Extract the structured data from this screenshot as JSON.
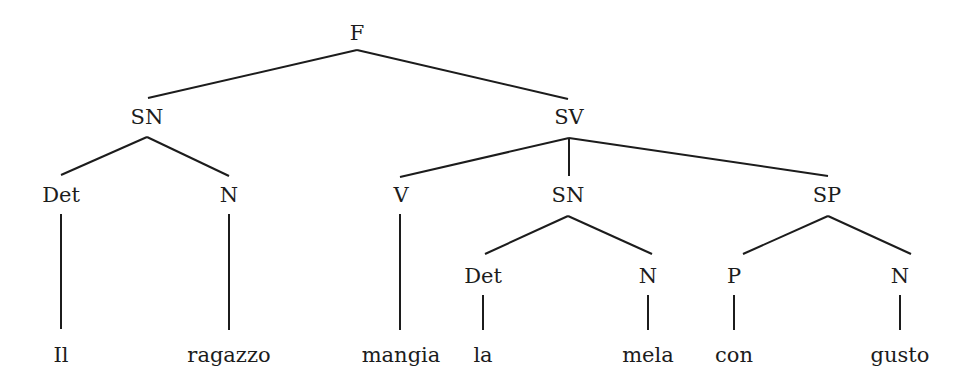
{
  "diagram": {
    "type": "syntax-tree",
    "nodes": [
      {
        "id": "F",
        "label": "F",
        "x": 357,
        "y": 40,
        "kind": "category"
      },
      {
        "id": "SN1",
        "label": "SN",
        "x": 147,
        "y": 124,
        "kind": "category"
      },
      {
        "id": "SV",
        "label": "SV",
        "x": 569,
        "y": 124,
        "kind": "category"
      },
      {
        "id": "Det1",
        "label": "Det",
        "x": 61,
        "y": 202,
        "kind": "category"
      },
      {
        "id": "N1",
        "label": "N",
        "x": 229,
        "y": 202,
        "kind": "category"
      },
      {
        "id": "V",
        "label": "V",
        "x": 401,
        "y": 202,
        "kind": "category"
      },
      {
        "id": "SN2",
        "label": "SN",
        "x": 568,
        "y": 202,
        "kind": "category"
      },
      {
        "id": "SP",
        "label": "SP",
        "x": 827,
        "y": 202,
        "kind": "category"
      },
      {
        "id": "Det2",
        "label": "Det",
        "x": 483,
        "y": 283,
        "kind": "category"
      },
      {
        "id": "N2",
        "label": "N",
        "x": 648,
        "y": 283,
        "kind": "category"
      },
      {
        "id": "P",
        "label": "P",
        "x": 734,
        "y": 283,
        "kind": "category"
      },
      {
        "id": "N3",
        "label": "N",
        "x": 900,
        "y": 283,
        "kind": "category"
      },
      {
        "id": "w1",
        "label": "Il",
        "x": 61,
        "y": 362,
        "kind": "word"
      },
      {
        "id": "w2",
        "label": "ragazzo",
        "x": 229,
        "y": 362,
        "kind": "word"
      },
      {
        "id": "w3",
        "label": "mangia",
        "x": 401,
        "y": 362,
        "kind": "word"
      },
      {
        "id": "w4",
        "label": "la",
        "x": 483,
        "y": 362,
        "kind": "word"
      },
      {
        "id": "w5",
        "label": "mela",
        "x": 648,
        "y": 362,
        "kind": "word"
      },
      {
        "id": "w6",
        "label": "con",
        "x": 734,
        "y": 362,
        "kind": "word"
      },
      {
        "id": "w7",
        "label": "gusto",
        "x": 900,
        "y": 362,
        "kind": "word"
      }
    ],
    "edges": [
      {
        "from": "F",
        "to": "SN1",
        "x1": 357,
        "y1": 50,
        "x2": 148,
        "y2": 98
      },
      {
        "from": "F",
        "to": "SV",
        "x1": 357,
        "y1": 50,
        "x2": 568,
        "y2": 99
      },
      {
        "from": "SN1",
        "to": "Det1",
        "x1": 147,
        "y1": 137,
        "x2": 61,
        "y2": 175
      },
      {
        "from": "SN1",
        "to": "N1",
        "x1": 147,
        "y1": 137,
        "x2": 229,
        "y2": 176
      },
      {
        "from": "SV",
        "to": "V",
        "x1": 569,
        "y1": 138,
        "x2": 400,
        "y2": 177
      },
      {
        "from": "SV",
        "to": "SN2",
        "x1": 569,
        "y1": 138,
        "x2": 569,
        "y2": 176
      },
      {
        "from": "SV",
        "to": "SP",
        "x1": 569,
        "y1": 138,
        "x2": 828,
        "y2": 176
      },
      {
        "from": "SN2",
        "to": "Det2",
        "x1": 568,
        "y1": 216,
        "x2": 485,
        "y2": 254
      },
      {
        "from": "SN2",
        "to": "N2",
        "x1": 568,
        "y1": 216,
        "x2": 652,
        "y2": 254
      },
      {
        "from": "SP",
        "to": "P",
        "x1": 828,
        "y1": 216,
        "x2": 743,
        "y2": 254
      },
      {
        "from": "SP",
        "to": "N3",
        "x1": 828,
        "y1": 216,
        "x2": 911,
        "y2": 254
      },
      {
        "from": "Det1",
        "to": "w1",
        "x1": 61,
        "y1": 214,
        "x2": 61,
        "y2": 329
      },
      {
        "from": "N1",
        "to": "w2",
        "x1": 229,
        "y1": 214,
        "x2": 229,
        "y2": 330
      },
      {
        "from": "V",
        "to": "w3",
        "x1": 400,
        "y1": 214,
        "x2": 400,
        "y2": 330
      },
      {
        "from": "Det2",
        "to": "w4",
        "x1": 483,
        "y1": 295,
        "x2": 483,
        "y2": 330
      },
      {
        "from": "N2",
        "to": "w5",
        "x1": 648,
        "y1": 295,
        "x2": 648,
        "y2": 330
      },
      {
        "from": "P",
        "to": "w6",
        "x1": 734,
        "y1": 295,
        "x2": 734,
        "y2": 330
      },
      {
        "from": "N3",
        "to": "w7",
        "x1": 900,
        "y1": 295,
        "x2": 900,
        "y2": 330
      }
    ],
    "sentence": "Il ragazzo mangia la mela con gusto",
    "colors": {
      "ink": "#1c1c1c",
      "background": "#ffffff"
    }
  }
}
